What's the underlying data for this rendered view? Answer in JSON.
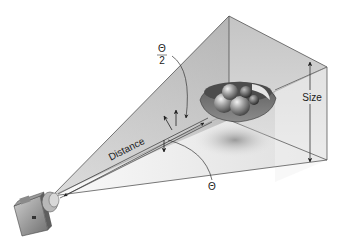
{
  "diagram": {
    "type": "camera-viewing-frustum",
    "labels": {
      "half_angle": {
        "numerator": "Θ",
        "denominator": "2"
      },
      "full_angle": "Θ",
      "distance": "Distance",
      "size": "Size"
    },
    "elements": [
      "camera",
      "viewing frustum (pyramid)",
      "bowl of fruit (subject)",
      "distance arrow",
      "size arrow",
      "field-of-view angle arcs"
    ],
    "colors": {
      "frustum_light": "#e6e6e6",
      "frustum_mid": "#c8c8c8",
      "frustum_dark": "#a9a9a9",
      "line": "#333333",
      "background": "#ffffff"
    }
  }
}
